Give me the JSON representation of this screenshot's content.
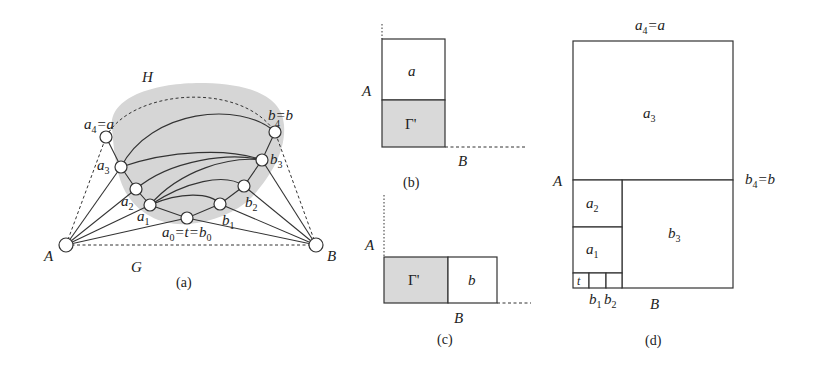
{
  "panel_a": {
    "caption": "(a)",
    "region_label_H": "H",
    "region_label_G": "G",
    "blob_color": "#d6d6d6",
    "terminals": {
      "A": {
        "label": "A",
        "x": 66,
        "y": 245
      },
      "B": {
        "label": "B",
        "x": 316,
        "y": 245
      }
    },
    "nodes": {
      "a4": {
        "x": 106,
        "y": 137,
        "label": "a",
        "sub": "4",
        "suffix": "=a"
      },
      "a3": {
        "x": 121,
        "y": 167,
        "label": "a",
        "sub": "3"
      },
      "a2": {
        "x": 136,
        "y": 189,
        "label": "a",
        "sub": "2"
      },
      "a1": {
        "x": 150,
        "y": 205,
        "label": "a",
        "sub": "1"
      },
      "t": {
        "x": 187,
        "y": 218,
        "label_parts": [
          "a",
          "0",
          "=t=b",
          "0"
        ]
      },
      "b1": {
        "x": 220,
        "y": 204,
        "label": "b",
        "sub": "1"
      },
      "b2": {
        "x": 244,
        "y": 186,
        "label": "b",
        "sub": "2"
      },
      "b3": {
        "x": 262,
        "y": 160,
        "label": "b",
        "sub": "3"
      },
      "b4": {
        "x": 275,
        "y": 132,
        "label": "b",
        "sub": "4",
        "prefix": "b=b"
      }
    }
  },
  "panel_b": {
    "caption": "(b)",
    "top_cell": "a",
    "bottom_cell": "Γ'",
    "axis_A": "A",
    "axis_B": "B"
  },
  "panel_c": {
    "caption": "(c)",
    "left_cell": "Γ'",
    "right_cell": "b",
    "axis_A": "A",
    "axis_B": "B"
  },
  "panel_d": {
    "caption": "(d)",
    "top_label_main": "a",
    "top_label_sub": "4",
    "top_label_suffix": "=a",
    "right_label_main": "b",
    "right_label_sub": "4",
    "right_label_suffix": "=b",
    "axis_A": "A",
    "axis_B": "B",
    "cells": {
      "a3": {
        "main": "a",
        "sub": "3"
      },
      "a2": {
        "main": "a",
        "sub": "2"
      },
      "a1": {
        "main": "a",
        "sub": "1"
      },
      "b3": {
        "main": "b",
        "sub": "3"
      },
      "t": {
        "main": "t"
      }
    },
    "bottom_labels": [
      {
        "main": "b",
        "sub": "1"
      },
      {
        "main": "b",
        "sub": "2"
      }
    ]
  }
}
